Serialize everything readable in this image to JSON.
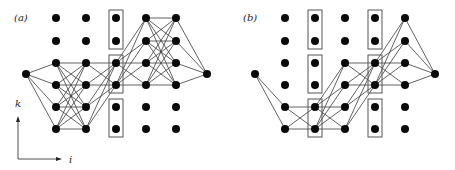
{
  "figure": {
    "panels": [
      {
        "label": "(a)",
        "label_pos": [
          14,
          21
        ],
        "cols_x": [
          56,
          86,
          116,
          146,
          176
        ],
        "rows_y": [
          18,
          41,
          63,
          85,
          107,
          129
        ],
        "left_node": [
          26,
          74
        ],
        "right_node": [
          207,
          74
        ],
        "boxes": [
          {
            "col": 2,
            "rows": [
              0,
              1
            ]
          },
          {
            "col": 2,
            "rows": [
              2,
              3
            ]
          },
          {
            "col": 2,
            "rows": [
              4,
              5
            ]
          }
        ],
        "edges": {
          "left_to": [
            [
              0,
              2
            ],
            [
              0,
              3
            ],
            [
              0,
              4
            ],
            [
              0,
              5
            ]
          ],
          "stage_pairs": [
            {
              "from_col": 0,
              "from_rows": [
                2,
                3,
                4,
                5
              ],
              "to_col": 1,
              "to_rows": [
                2,
                3,
                4,
                5
              ]
            },
            {
              "from_col": 1,
              "from_rows": [
                2,
                3,
                4,
                5
              ],
              "to_col": 2,
              "to_rows": [
                2,
                3
              ]
            },
            {
              "from_col": 2,
              "from_rows": [
                2,
                3
              ],
              "to_col": 3,
              "to_rows": [
                0,
                1,
                2,
                3
              ]
            },
            {
              "from_col": 3,
              "from_rows": [
                0,
                1,
                2,
                3
              ],
              "to_col": 4,
              "to_rows": [
                0,
                1,
                2,
                3
              ]
            }
          ],
          "right_from": [
            [
              4,
              0
            ],
            [
              4,
              1
            ],
            [
              4,
              2
            ],
            [
              4,
              3
            ]
          ]
        }
      },
      {
        "label": "(b)",
        "label_pos": [
          243,
          21
        ],
        "cols_x": [
          285,
          315,
          345,
          375,
          405
        ],
        "rows_y": [
          18,
          41,
          63,
          85,
          107,
          129
        ],
        "left_node": [
          255,
          74
        ],
        "right_node": [
          435,
          74
        ],
        "boxes": [
          {
            "col": 1,
            "rows": [
              0,
              1
            ]
          },
          {
            "col": 1,
            "rows": [
              2,
              3
            ]
          },
          {
            "col": 1,
            "rows": [
              4,
              5
            ]
          },
          {
            "col": 3,
            "rows": [
              0,
              1
            ]
          },
          {
            "col": 3,
            "rows": [
              2,
              3
            ]
          },
          {
            "col": 3,
            "rows": [
              4,
              5
            ]
          }
        ],
        "edges": {
          "left_to": [
            [
              0,
              4
            ],
            [
              0,
              5
            ]
          ],
          "stage_pairs": [
            {
              "from_col": 0,
              "from_rows": [
                4,
                5
              ],
              "to_col": 1,
              "to_rows": [
                4,
                5
              ]
            },
            {
              "from_col": 1,
              "from_rows": [
                4,
                5
              ],
              "to_col": 2,
              "to_rows": [
                2,
                3,
                4,
                5
              ]
            },
            {
              "from_col": 2,
              "from_rows": [
                2,
                3,
                4,
                5
              ],
              "to_col": 3,
              "to_rows": [
                2,
                3
              ]
            },
            {
              "from_col": 3,
              "from_rows": [
                2,
                3
              ],
              "to_col": 4,
              "to_rows": [
                0,
                1,
                2,
                3
              ]
            }
          ],
          "right_from": [
            [
              4,
              0
            ],
            [
              4,
              1
            ],
            [
              4,
              2
            ],
            [
              4,
              3
            ]
          ]
        }
      }
    ],
    "axes": {
      "vertical_label": "k",
      "horizontal_label": "i",
      "origin": [
        18,
        159
      ],
      "v_end": [
        18,
        116
      ],
      "h_end": [
        62,
        159
      ]
    }
  }
}
